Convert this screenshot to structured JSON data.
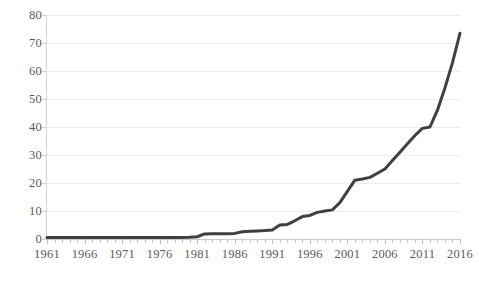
{
  "chart_data": {
    "type": "line",
    "title": "",
    "subtitle": "",
    "xlabel": "",
    "ylabel": "",
    "xlim": [
      1961,
      2016
    ],
    "ylim": [
      0,
      80
    ],
    "grid": true,
    "legend": false,
    "legend_position": "none",
    "line_color": "#404040",
    "gridline_color": "#ededed",
    "tick_label_color": "#5a5a5a",
    "background_color": "#ffffff",
    "y_ticks": [
      0,
      10,
      20,
      30,
      40,
      50,
      60,
      70,
      80
    ],
    "y_tick_labels": [
      "0",
      "10",
      "20",
      "30",
      "40",
      "50",
      "60",
      "70",
      "80"
    ],
    "x_ticks": [
      1961,
      1966,
      1971,
      1976,
      1981,
      1986,
      1991,
      1996,
      2001,
      2006,
      2011,
      2016
    ],
    "x_tick_labels": [
      "1961",
      "1966",
      "1971",
      "1976",
      "1981",
      "1986",
      "1991",
      "1996",
      "2001",
      "2006",
      "2011",
      "2016"
    ],
    "x": [
      1961,
      1962,
      1963,
      1964,
      1965,
      1966,
      1967,
      1968,
      1969,
      1970,
      1971,
      1972,
      1973,
      1974,
      1975,
      1976,
      1977,
      1978,
      1979,
      1980,
      1981,
      1982,
      1983,
      1984,
      1985,
      1986,
      1987,
      1988,
      1989,
      1990,
      1991,
      1992,
      1993,
      1994,
      1995,
      1996,
      1997,
      1998,
      1999,
      2000,
      1996,
      2002,
      2003,
      2004,
      2005,
      2006,
      2007,
      2008,
      2009,
      2010,
      2011,
      2012,
      2013,
      2014,
      2015,
      2016
    ],
    "values": [
      0.5,
      0.5,
      0.5,
      0.5,
      0.5,
      0.5,
      0.5,
      0.5,
      0.5,
      0.5,
      0.5,
      0.5,
      0.5,
      0.5,
      0.5,
      0.5,
      0.5,
      0.5,
      0.5,
      0.6,
      0.8,
      1.8,
      1.9,
      1.9,
      1.9,
      2.0,
      2.6,
      2.8,
      2.9,
      3.0,
      3.2,
      5.0,
      5.2,
      6.5,
      8.0,
      8.4,
      9.5,
      10.0,
      10.4,
      13.0,
      17.0,
      21.0,
      21.4,
      22.0,
      23.5,
      25.0,
      28.0,
      31.0,
      34.0,
      37.0,
      39.5,
      40.0,
      46.0,
      54.0,
      63.0,
      73.5
    ],
    "series": [
      {
        "name": "series-1",
        "color": "#404040",
        "points": [
          {
            "year": 1961,
            "value": 0.5
          },
          {
            "year": 1962,
            "value": 0.5
          },
          {
            "year": 1963,
            "value": 0.5
          },
          {
            "year": 1964,
            "value": 0.5
          },
          {
            "year": 1965,
            "value": 0.5
          },
          {
            "year": 1966,
            "value": 0.5
          },
          {
            "year": 1967,
            "value": 0.5
          },
          {
            "year": 1968,
            "value": 0.5
          },
          {
            "year": 1969,
            "value": 0.5
          },
          {
            "year": 1970,
            "value": 0.5
          },
          {
            "year": 1971,
            "value": 0.5
          },
          {
            "year": 1972,
            "value": 0.5
          },
          {
            "year": 1973,
            "value": 0.5
          },
          {
            "year": 1974,
            "value": 0.5
          },
          {
            "year": 1975,
            "value": 0.5
          },
          {
            "year": 1976,
            "value": 0.5
          },
          {
            "year": 1977,
            "value": 0.5
          },
          {
            "year": 1978,
            "value": 0.5
          },
          {
            "year": 1979,
            "value": 0.5
          },
          {
            "year": 1980,
            "value": 0.6
          },
          {
            "year": 1981,
            "value": 0.8
          },
          {
            "year": 1982,
            "value": 1.8
          },
          {
            "year": 1983,
            "value": 1.9
          },
          {
            "year": 1984,
            "value": 1.9
          },
          {
            "year": 1985,
            "value": 1.9
          },
          {
            "year": 1986,
            "value": 2.0
          },
          {
            "year": 1987,
            "value": 2.6
          },
          {
            "year": 1988,
            "value": 2.8
          },
          {
            "year": 1989,
            "value": 2.9
          },
          {
            "year": 1990,
            "value": 3.0
          },
          {
            "year": 1991,
            "value": 3.2
          },
          {
            "year": 1992,
            "value": 5.0
          },
          {
            "year": 1993,
            "value": 5.2
          },
          {
            "year": 1994,
            "value": 6.5
          },
          {
            "year": 1995,
            "value": 8.0
          },
          {
            "year": 1996,
            "value": 8.4
          },
          {
            "year": 1997,
            "value": 9.5
          },
          {
            "year": 1998,
            "value": 10.0
          },
          {
            "year": 1999,
            "value": 10.4
          },
          {
            "year": 2000,
            "value": 13.0
          },
          {
            "year": 2001,
            "value": 17.0
          },
          {
            "year": 2002,
            "value": 21.0
          },
          {
            "year": 2003,
            "value": 21.4
          },
          {
            "year": 2004,
            "value": 22.0
          },
          {
            "year": 2005,
            "value": 23.5
          },
          {
            "year": 2006,
            "value": 25.0
          },
          {
            "year": 2007,
            "value": 28.0
          },
          {
            "year": 2008,
            "value": 31.0
          },
          {
            "year": 2009,
            "value": 34.0
          },
          {
            "year": 2010,
            "value": 37.0
          },
          {
            "year": 2011,
            "value": 39.5
          },
          {
            "year": 2012,
            "value": 40.0
          },
          {
            "year": 2013,
            "value": 46.0
          },
          {
            "year": 2014,
            "value": 54.0
          },
          {
            "year": 2015,
            "value": 63.0
          },
          {
            "year": 2016,
            "value": 73.5
          }
        ]
      }
    ]
  }
}
